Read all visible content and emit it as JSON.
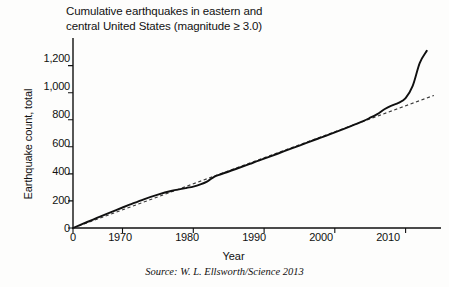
{
  "figure": {
    "title": "Cumulative earthquakes in eastern and\ncentral United States (magnitude ≥ 3.0)",
    "source_note": "Source: W. L. Ellsworth/Science 2013",
    "background_color": "#fdfdfc",
    "line_color": "#101010",
    "trend_color": "#3a3a3a"
  },
  "chart_data": {
    "type": "line",
    "title": "Cumulative earthquakes in eastern and central United States (magnitude ≥ 3.0)",
    "xlabel": "Year",
    "ylabel": "Earthquake count, total",
    "xlim": [
      1963,
      2015
    ],
    "ylim": [
      0,
      1360
    ],
    "grid": false,
    "legend": "none",
    "x_ticks": [
      "0",
      "1970",
      "1980",
      "1990",
      "2000",
      "2010"
    ],
    "x_tick_values": [
      1963,
      1970,
      1980,
      1990,
      2000,
      2010
    ],
    "y_ticks": [
      "0",
      "200",
      "400",
      "600",
      "800",
      "1,000",
      "1,200"
    ],
    "y_tick_values": [
      0,
      200,
      400,
      600,
      800,
      1000,
      1200
    ],
    "series": [
      {
        "name": "Cumulative earthquake count",
        "style": "solid",
        "x": [
          1963,
          1965,
          1967,
          1969,
          1971,
          1973,
          1975,
          1977,
          1979,
          1980,
          1981,
          1982,
          1983,
          1984,
          1986,
          1988,
          1990,
          1992,
          1994,
          1996,
          1998,
          2000,
          2002,
          2004,
          2005,
          2006,
          2007,
          2008,
          2009,
          2010,
          2011,
          2012,
          2013
        ],
        "values": [
          0,
          44,
          88,
          131,
          172,
          212,
          247,
          276,
          296,
          306,
          322,
          345,
          380,
          399,
          436,
          474,
          512,
          551,
          590,
          629,
          668,
          707,
          748,
          790,
          815,
          842,
          878,
          905,
          925,
          960,
          1050,
          1220,
          1310
        ]
      },
      {
        "name": "Historical trend (linear fit)",
        "style": "dashed",
        "x": [
          1963,
          2014
        ],
        "values": [
          0,
          980
        ]
      }
    ],
    "annotations": [
      "Solid curve tracks cumulative count; dashed line is the long-term linear trend",
      "Sharp departure above trend begins around 2009"
    ]
  }
}
